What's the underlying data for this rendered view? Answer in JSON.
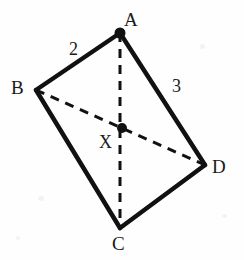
{
  "figure": {
    "type": "geometry-diagram",
    "background_color": "#fefefe",
    "stroke_color": "#111111",
    "solid_stroke_width": 4,
    "dashed_stroke_width": 3,
    "dash_pattern": "9 7",
    "vertices": [
      {
        "id": "A",
        "label": "A",
        "x": 120,
        "y": 33,
        "dot": true,
        "dot_radius": 5.5
      },
      {
        "id": "B",
        "label": "B",
        "x": 36,
        "y": 90,
        "dot": false,
        "dot_radius": 0
      },
      {
        "id": "C",
        "label": "C",
        "x": 120,
        "y": 228,
        "dot": false,
        "dot_radius": 0
      },
      {
        "id": "D",
        "label": "D",
        "x": 205,
        "y": 165,
        "dot": false,
        "dot_radius": 0
      }
    ],
    "interior_points": [
      {
        "id": "X",
        "label": "X",
        "x": 122,
        "y": 128,
        "dot": true,
        "dot_radius": 5
      }
    ],
    "edges": [
      {
        "id": "AB",
        "from": "A",
        "to": "B",
        "style": "solid",
        "label": "2"
      },
      {
        "id": "BC",
        "from": "B",
        "to": "C",
        "style": "solid",
        "label": ""
      },
      {
        "id": "CD",
        "from": "C",
        "to": "D",
        "style": "solid",
        "label": ""
      },
      {
        "id": "AD",
        "from": "A",
        "to": "D",
        "style": "solid",
        "label": "3"
      }
    ],
    "diagonals": [
      {
        "id": "AC",
        "from": "A",
        "to": "C",
        "style": "dashed",
        "passes_through": "X"
      },
      {
        "id": "BD",
        "from": "B",
        "to": "D",
        "style": "dashed",
        "passes_through": "X"
      }
    ],
    "labels": {
      "vertex_a": "A",
      "vertex_b": "B",
      "vertex_c": "C",
      "vertex_d": "D",
      "point_x": "X",
      "side_ab_length": "2",
      "side_ad_length": "3"
    }
  }
}
